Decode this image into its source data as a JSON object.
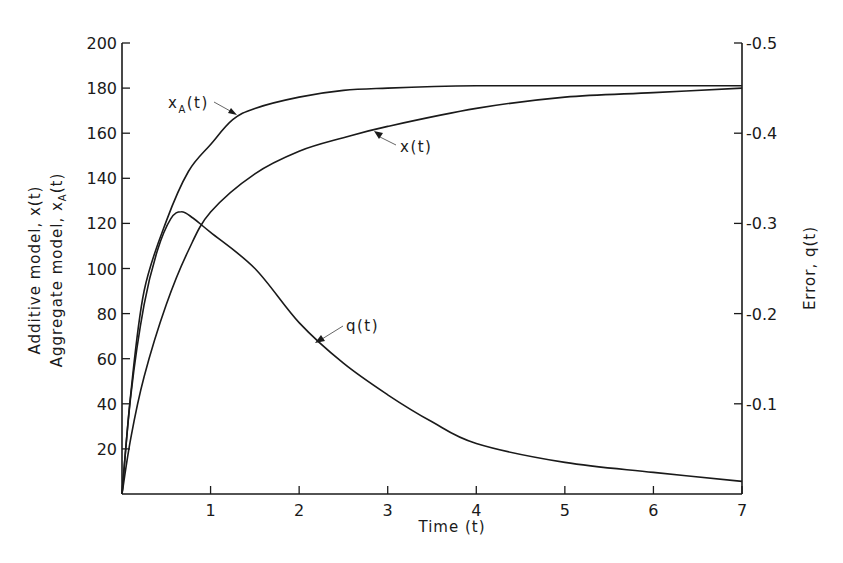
{
  "chart_data": {
    "type": "line",
    "title": "",
    "xlabel": "Time (t)",
    "ylabel_left": [
      "Additive model, x(t)",
      "Aggregate model, xA(t)"
    ],
    "ylabel_right": "Error, q(t)",
    "xlim": [
      0,
      7
    ],
    "ylim_left": [
      0,
      200
    ],
    "ylim_right": [
      0,
      0.5
    ],
    "x_ticks": [
      1,
      2,
      3,
      4,
      5,
      6,
      7
    ],
    "y_ticks_left": [
      20,
      40,
      60,
      80,
      100,
      120,
      140,
      160,
      180,
      200
    ],
    "y_ticks_right": [
      0.1,
      0.2,
      0.3,
      0.4,
      0.5
    ],
    "y_tick_labels_right": [
      "-0.1",
      "-0.2",
      "-0.3",
      "-0.4",
      "-0.5"
    ],
    "grid": false,
    "legend": "none (inline curve annotations with leader arrows)",
    "series": [
      {
        "name": "xA(t)",
        "axis": "left",
        "x": [
          0,
          0.1,
          0.25,
          0.5,
          0.75,
          1,
          1.25,
          1.5,
          2,
          2.5,
          3,
          4,
          5,
          6,
          7
        ],
        "values": [
          0,
          45,
          90,
          121,
          143,
          155,
          166,
          171,
          176,
          179,
          180,
          181,
          181,
          181,
          181
        ]
      },
      {
        "name": "x(t)",
        "axis": "left",
        "x": [
          0,
          0.1,
          0.25,
          0.5,
          0.75,
          1,
          1.5,
          2,
          2.5,
          3,
          4,
          5,
          6,
          7
        ],
        "values": [
          0,
          25,
          52,
          84,
          108,
          125,
          142,
          152,
          158,
          163,
          171,
          176,
          178,
          180
        ]
      },
      {
        "name": "q(t)",
        "axis": "right",
        "x": [
          0,
          0.1,
          0.25,
          0.4,
          0.55,
          0.67,
          0.8,
          1,
          1.5,
          2,
          2.5,
          3,
          3.5,
          4,
          5,
          6,
          7
        ],
        "values": [
          0,
          0.11,
          0.21,
          0.27,
          0.305,
          0.313,
          0.306,
          0.29,
          0.25,
          0.19,
          0.145,
          0.11,
          0.08,
          0.056,
          0.035,
          0.024,
          0.014
        ]
      }
    ],
    "annotations": [
      {
        "text": "xA(t)",
        "points_to": "xA(t)",
        "near_x": 1.25
      },
      {
        "text": "x(t)",
        "points_to": "x(t)",
        "near_x": 2.6
      },
      {
        "text": "q(t)",
        "points_to": "q(t)",
        "near_x": 2.2
      }
    ]
  },
  "labels": {
    "xlabel": "Time (t)",
    "ylabel_left_1": "Additive model, x(t)",
    "ylabel_left_2_main": "Aggregate model, x",
    "ylabel_left_2_sub": "A",
    "ylabel_left_2_tail": "(t)",
    "ylabel_right": "Error, q(t)",
    "annot_xA_main": "x",
    "annot_xA_sub": "A",
    "annot_xA_tail": "(t)",
    "annot_x": "x(t)",
    "annot_q": "q(t)"
  }
}
